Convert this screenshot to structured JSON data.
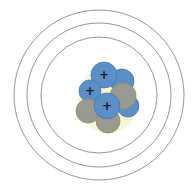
{
  "diagram": {
    "type": "bohr-atom-model",
    "center": [
      99,
      95
    ],
    "shells": [
      {
        "name": "inner-shell",
        "r": 58
      },
      {
        "name": "middle-shell",
        "r": 72
      },
      {
        "name": "outer-shell",
        "r": 85
      }
    ],
    "shell_color": "#8a8a8a",
    "colors": {
      "proton": "#5b8fc7",
      "proton_stroke": "#4a76a8",
      "neutron": "#9a9a92",
      "neutron_stroke": "#8f8f5a",
      "glow": "#f2f2c8"
    },
    "nucleus": [
      {
        "kind": "proton",
        "cx": 122,
        "cy": 81,
        "r": 12,
        "label": ""
      },
      {
        "kind": "proton",
        "cx": 128,
        "cy": 106,
        "r": 11,
        "label": ""
      },
      {
        "kind": "proton",
        "cx": 104,
        "cy": 75,
        "r": 13,
        "label": "+"
      },
      {
        "kind": "proton",
        "cx": 90,
        "cy": 91,
        "r": 11,
        "label": "+"
      },
      {
        "kind": "neutron",
        "cx": 88,
        "cy": 111,
        "r": 12,
        "label": ""
      },
      {
        "kind": "neutron",
        "cx": 108,
        "cy": 121,
        "r": 12,
        "label": ""
      },
      {
        "kind": "neutron",
        "cx": 123,
        "cy": 96,
        "r": 13,
        "label": ""
      },
      {
        "kind": "proton",
        "cx": 107,
        "cy": 106,
        "r": 13,
        "label": "+"
      }
    ]
  }
}
